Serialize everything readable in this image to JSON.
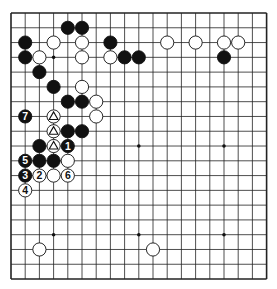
{
  "board": {
    "size": 19,
    "origin_x": 11,
    "origin_y": 13,
    "spacing_x": 14.2,
    "spacing_y": 14.78,
    "line_color": "#222222",
    "star_points": [
      [
        3,
        3
      ],
      [
        9,
        3
      ],
      [
        15,
        3
      ],
      [
        3,
        9
      ],
      [
        9,
        9
      ],
      [
        15,
        9
      ],
      [
        3,
        15
      ],
      [
        9,
        15
      ],
      [
        15,
        15
      ]
    ]
  },
  "stones": [
    {
      "c": 4,
      "r": 1,
      "color": "black"
    },
    {
      "c": 5,
      "r": 1,
      "color": "black"
    },
    {
      "c": 1,
      "r": 2,
      "color": "black"
    },
    {
      "c": 3,
      "r": 2,
      "color": "white"
    },
    {
      "c": 5,
      "r": 2,
      "color": "white"
    },
    {
      "c": 7,
      "r": 2,
      "color": "black"
    },
    {
      "c": 11,
      "r": 2,
      "color": "white"
    },
    {
      "c": 13,
      "r": 2,
      "color": "white"
    },
    {
      "c": 15,
      "r": 2,
      "color": "white"
    },
    {
      "c": 16,
      "r": 2,
      "color": "white"
    },
    {
      "c": 1,
      "r": 3,
      "color": "black"
    },
    {
      "c": 2,
      "r": 3,
      "color": "white"
    },
    {
      "c": 5,
      "r": 3,
      "color": "white"
    },
    {
      "c": 7,
      "r": 3,
      "color": "white"
    },
    {
      "c": 8,
      "r": 3,
      "color": "black"
    },
    {
      "c": 9,
      "r": 3,
      "color": "black"
    },
    {
      "c": 15,
      "r": 3,
      "color": "black"
    },
    {
      "c": 2,
      "r": 4,
      "color": "black"
    },
    {
      "c": 3,
      "r": 5,
      "color": "black"
    },
    {
      "c": 5,
      "r": 5,
      "color": "white"
    },
    {
      "c": 4,
      "r": 6,
      "color": "black"
    },
    {
      "c": 5,
      "r": 6,
      "color": "black"
    },
    {
      "c": 6,
      "r": 6,
      "color": "white"
    },
    {
      "c": 1,
      "r": 7,
      "color": "black",
      "label": "7"
    },
    {
      "c": 3,
      "r": 7,
      "color": "white",
      "mark": "triangle"
    },
    {
      "c": 6,
      "r": 7,
      "color": "white"
    },
    {
      "c": 3,
      "r": 8,
      "color": "white",
      "mark": "triangle"
    },
    {
      "c": 4,
      "r": 8,
      "color": "black"
    },
    {
      "c": 5,
      "r": 8,
      "color": "black"
    },
    {
      "c": 2,
      "r": 9,
      "color": "black"
    },
    {
      "c": 3,
      "r": 9,
      "color": "white",
      "mark": "triangle"
    },
    {
      "c": 4,
      "r": 9,
      "color": "black",
      "label": "1"
    },
    {
      "c": 1,
      "r": 10,
      "color": "black",
      "label": "5"
    },
    {
      "c": 2,
      "r": 10,
      "color": "black"
    },
    {
      "c": 3,
      "r": 10,
      "color": "black"
    },
    {
      "c": 4,
      "r": 10,
      "color": "white"
    },
    {
      "c": 1,
      "r": 11,
      "color": "black",
      "label": "3"
    },
    {
      "c": 2,
      "r": 11,
      "color": "white",
      "label": "2"
    },
    {
      "c": 3,
      "r": 11,
      "color": "white"
    },
    {
      "c": 4,
      "r": 11,
      "color": "white",
      "label": "6"
    },
    {
      "c": 1,
      "r": 12,
      "color": "white",
      "label": "4"
    },
    {
      "c": 2,
      "r": 16,
      "color": "white"
    },
    {
      "c": 10,
      "r": 16,
      "color": "white"
    }
  ]
}
